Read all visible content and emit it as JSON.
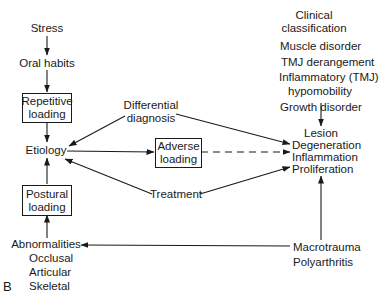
{
  "figure_label": "B",
  "left_column": {
    "stress": "Stress",
    "oral_habits": "Oral habits",
    "repetitive_loading": [
      "Repetitive",
      "loading"
    ],
    "etiology": "Etiology",
    "postural_loading": [
      "Postural",
      "loading"
    ],
    "abnormalities": "Abnormalities",
    "abnormality_types": [
      "Occlusal",
      "Articular",
      "Skeletal"
    ]
  },
  "middle": {
    "differential_diagnosis": [
      "Differential",
      "diagnosis"
    ],
    "adverse_loading": [
      "Adverse",
      "loading"
    ],
    "treatment": "Treatment"
  },
  "right_column": {
    "clinical_classification": [
      "Clinical",
      "classification"
    ],
    "classifications": [
      "Muscle disorder",
      "TMJ derangement",
      "Inflammatory (TMJ)",
      "hypomobility",
      "Growth disorder"
    ],
    "lesion": "Lesion",
    "lesion_types": [
      "Degeneration",
      "Inflammation",
      "Proliferation"
    ],
    "macrotrauma": "Macrotrauma",
    "polyarthritis": "Polyarthritis"
  },
  "edges": [
    {
      "from": "Stress",
      "to": "Oral habits",
      "style": "solid"
    },
    {
      "from": "Oral habits",
      "to": "Repetitive loading",
      "style": "solid"
    },
    {
      "from": "Repetitive loading",
      "to": "Etiology",
      "style": "solid"
    },
    {
      "from": "Postural loading",
      "to": "Etiology",
      "style": "solid"
    },
    {
      "from": "Abnormalities",
      "to": "Postural loading",
      "style": "solid"
    },
    {
      "from": "Differential diagnosis",
      "to": "Etiology",
      "style": "solid"
    },
    {
      "from": "Differential diagnosis",
      "to": "Degeneration",
      "style": "solid"
    },
    {
      "from": "Etiology",
      "to": "Adverse loading",
      "style": "solid"
    },
    {
      "from": "Adverse loading",
      "to": "Inflammation",
      "style": "dashed"
    },
    {
      "from": "Treatment",
      "to": "Etiology",
      "style": "solid"
    },
    {
      "from": "Treatment",
      "to": "Proliferation",
      "style": "solid"
    },
    {
      "from": "Growth disorder",
      "to": "Lesion",
      "style": "solid"
    },
    {
      "from": "Macrotrauma",
      "to": "Proliferation",
      "style": "solid"
    },
    {
      "from": "Macrotrauma",
      "to": "Abnormalities",
      "style": "solid"
    }
  ]
}
